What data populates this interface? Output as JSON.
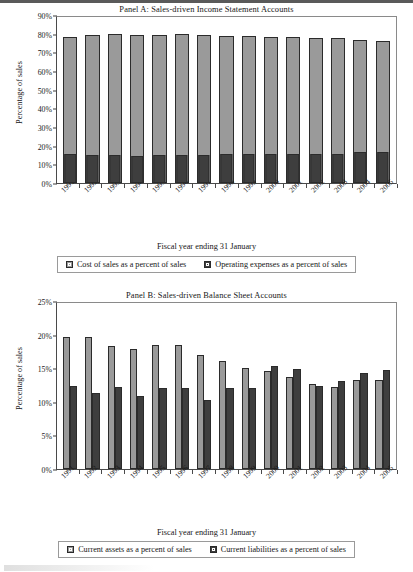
{
  "figure": {
    "shared_xlabel": "Fiscal year ending 31 January",
    "shared_ylabel": "Percentage of sales"
  },
  "panelA": {
    "title": "Panel A: Sales-driven Income Statement Accounts",
    "xlabel": "Fiscal year ending 31 January",
    "ylabel": "Percentage of sales",
    "legend": [
      {
        "label": "Cost of sales as a percent of sales",
        "swatch": "light-gray-swatch",
        "color": "#9a9a9a"
      },
      {
        "label": "Operating expenses as a percent of sales",
        "swatch": "dark-gray-swatch",
        "color": "#3e3e3e"
      }
    ],
    "yticks": [
      "0%",
      "10%",
      "20%",
      "30%",
      "40%",
      "50%",
      "60%",
      "70%",
      "80%",
      "90%"
    ]
  },
  "panelB": {
    "title": "Panel B: Sales-driven Balance Sheet Accounts",
    "xlabel": "Fiscal year ending 31 January",
    "ylabel": "Percentage of sales",
    "legend": [
      {
        "label": "Current assets as a percent of sales",
        "swatch": "light-gray-swatch",
        "color": "#9a9a9a"
      },
      {
        "label": "Current liabilities as a percent of sales",
        "swatch": "dark-gray-swatch",
        "color": "#3e3e3e"
      }
    ],
    "yticks": [
      "0%",
      "5%",
      "10%",
      "15%",
      "20%",
      "25%"
    ]
  },
  "chart_data": [
    {
      "type": "bar",
      "title": "Panel A: Sales-driven Income Statement Accounts",
      "xlabel": "Fiscal year ending 31 January",
      "ylabel": "Percentage of sales",
      "ylim": [
        0,
        90
      ],
      "ytick_step": 10,
      "grid": false,
      "legend_position": "below",
      "categories": [
        "1991",
        "1992",
        "1993",
        "1994",
        "1995",
        "1996",
        "1997",
        "1998",
        "1999",
        "2000",
        "2001",
        "2002",
        "2003",
        "2004",
        "2005"
      ],
      "series": [
        {
          "name": "Cost of sales as a percent of sales",
          "color": "#9a9a9a",
          "values": [
            78.0,
            79.3,
            79.8,
            79.1,
            79.1,
            79.6,
            79.5,
            78.9,
            78.8,
            78.1,
            78.0,
            77.8,
            77.8,
            76.5,
            76.3
          ]
        },
        {
          "name": "Operating expenses as a percent of sales",
          "color": "#3e3e3e",
          "values": [
            15.6,
            14.9,
            14.8,
            14.6,
            15.1,
            15.1,
            15.0,
            15.7,
            15.6,
            15.5,
            15.4,
            15.4,
            15.3,
            16.5,
            16.4
          ]
        }
      ]
    },
    {
      "type": "bar",
      "title": "Panel B: Sales-driven Balance Sheet Accounts",
      "xlabel": "Fiscal year ending 31 January",
      "ylabel": "Percentage of sales",
      "ylim": [
        0,
        25
      ],
      "ytick_step": 5,
      "grid": false,
      "legend_position": "below",
      "categories": [
        "1991",
        "1992",
        "1993",
        "1994",
        "1995",
        "1996",
        "1997",
        "1998",
        "1999",
        "2000",
        "2001",
        "2002",
        "2003",
        "2004",
        "2005"
      ],
      "series": [
        {
          "name": "Current assets as a percent of sales",
          "color": "#9a9a9a",
          "values": [
            19.6,
            19.6,
            18.3,
            17.9,
            18.4,
            18.4,
            16.9,
            16.1,
            15.1,
            14.6,
            13.7,
            12.7,
            12.2,
            13.2,
            13.2
          ]
        },
        {
          "name": "Current liabilities as a percent of sales",
          "color": "#3e3e3e",
          "values": [
            12.3,
            11.3,
            12.2,
            10.9,
            12.0,
            12.1,
            10.3,
            12.1,
            12.1,
            15.4,
            14.9,
            12.4,
            13.1,
            14.3,
            14.8
          ]
        }
      ]
    }
  ]
}
